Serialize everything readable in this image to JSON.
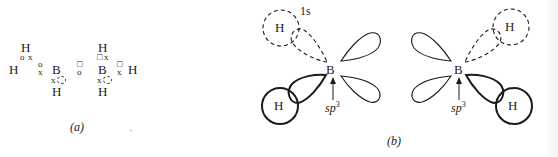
{
  "panel_a": {
    "caption": "(a)",
    "symbols": {
      "H": "H",
      "B": "B",
      "electron_x": "x",
      "electron_o": "o",
      "electron_sq": "□"
    }
  },
  "panel_b": {
    "caption": "(b)",
    "orbital_label_1s": "1s",
    "hybrid_label": "sp",
    "hybrid_sup": "3",
    "atom_H": "H",
    "atom_B": "B"
  }
}
